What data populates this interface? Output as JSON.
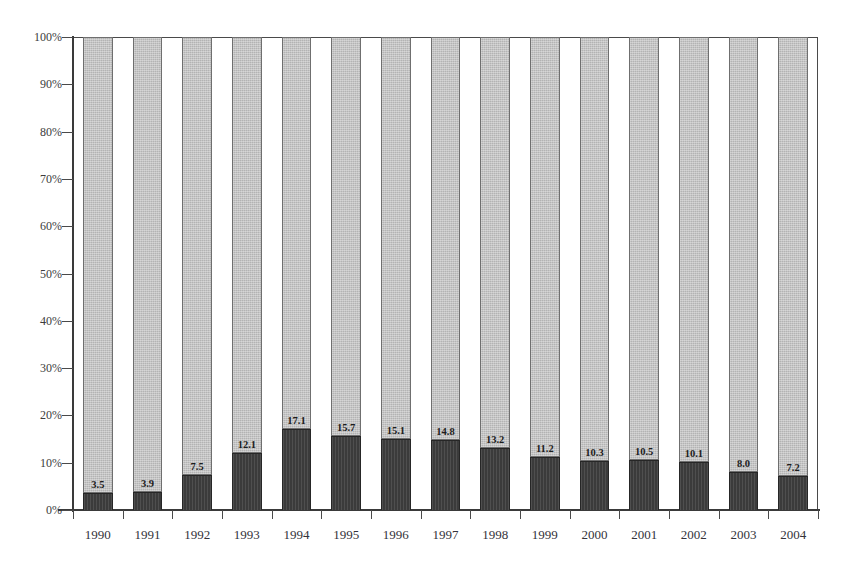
{
  "chart_data": {
    "type": "bar",
    "subtype": "100% stacked column",
    "title": "",
    "subtitle": "",
    "xlabel": "",
    "ylabel": "",
    "categories": [
      "1990",
      "1991",
      "1992",
      "1993",
      "1994",
      "1995",
      "1996",
      "1997",
      "1998",
      "1999",
      "2000",
      "2001",
      "2002",
      "2003",
      "2004"
    ],
    "ylim": [
      0,
      100
    ],
    "ytick_labels": [
      "0%",
      "10%",
      "20%",
      "30%",
      "40%",
      "50%",
      "60%",
      "70%",
      "80%",
      "90%",
      "100%"
    ],
    "ytick_values": [
      0,
      10,
      20,
      30,
      40,
      50,
      60,
      70,
      80,
      90,
      100
    ],
    "grid": false,
    "legend": "none",
    "series": [
      {
        "name": "lower-segment",
        "color": "#3b3b3b",
        "values": [
          3.5,
          3.9,
          7.5,
          12.1,
          17.1,
          15.7,
          15.1,
          14.8,
          13.2,
          11.2,
          10.3,
          10.5,
          10.1,
          8.0,
          7.2
        ],
        "data_labels": [
          "3.5",
          "3.9",
          "7.5",
          "12.1",
          "17.1",
          "15.7",
          "15.1",
          "14.8",
          "13.2",
          "11.2",
          "10.3",
          "10.5",
          "10.1",
          "8.0",
          "7.2"
        ]
      },
      {
        "name": "upper-segment",
        "color": "#b3b3b3",
        "values": [
          96.5,
          96.1,
          92.5,
          87.9,
          82.9,
          84.3,
          84.9,
          85.2,
          86.8,
          88.8,
          89.7,
          89.5,
          89.9,
          92.0,
          92.8
        ],
        "data_labels": []
      }
    ]
  },
  "colors": {
    "lower_segment": "#3b3b3b",
    "upper_segment": "#b3b3b3",
    "axis": "#3a3a3a",
    "frame": "#4a4a4a",
    "text": "#33333a",
    "background": "#ffffff"
  },
  "header": {
    "ghost_text": ""
  }
}
